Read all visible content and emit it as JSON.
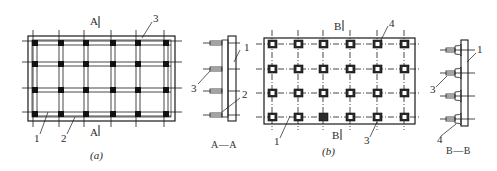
{
  "diagram": {
    "panel_a": {
      "caption": "(a)",
      "section_mark_top": "A",
      "section_mark_bottom": "A",
      "callouts": {
        "c1": "1",
        "c2": "2",
        "c3": "3"
      },
      "grid": {
        "columns": 6,
        "rows": 4
      }
    },
    "section_aa": {
      "title": "A—A",
      "callouts": {
        "c1": "1",
        "c2": "2",
        "c3": "3"
      }
    },
    "panel_b": {
      "caption": "(b)",
      "section_mark_top": "B",
      "section_mark_bottom": "B",
      "callouts": {
        "c1": "1",
        "c3": "3",
        "c4": "4"
      },
      "grid": {
        "columns": 6,
        "rows": 4
      }
    },
    "section_bb": {
      "title": "B—B",
      "callouts": {
        "c1": "1",
        "c3": "3",
        "c4": "4"
      }
    },
    "colors": {
      "ink": "#1a1a1a",
      "background": "#ffffff"
    }
  }
}
